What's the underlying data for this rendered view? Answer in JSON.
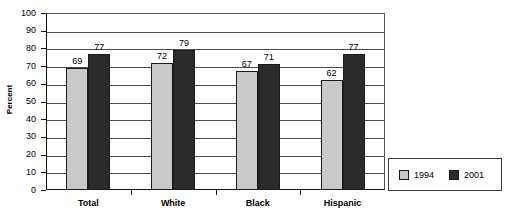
{
  "chart_data": {
    "type": "bar",
    "title": "",
    "subtitle": "",
    "xlabel": "",
    "ylabel": "Percent",
    "ylim": [
      0,
      100
    ],
    "ytick_step": 10,
    "yticks": [
      100,
      90,
      80,
      70,
      60,
      50,
      40,
      30,
      20,
      10,
      0
    ],
    "grid": true,
    "grid_axis": "y",
    "legend_position": "bottom-right",
    "categories": [
      "Total",
      "White",
      "Black",
      "Hispanic"
    ],
    "series": [
      {
        "name": "1994",
        "color": "#c9c9c9",
        "values": [
          69,
          72,
          67,
          62
        ]
      },
      {
        "name": "2001",
        "color": "#2b2b2b",
        "values": [
          77,
          79,
          71,
          77
        ]
      }
    ],
    "data_labels": [
      [
        "69",
        "72",
        "67",
        "62"
      ],
      [
        "77",
        "79",
        "71",
        "77"
      ]
    ]
  },
  "colors": {
    "series_1994": "#c9c9c9",
    "series_2001": "#2b2b2b",
    "axis": "#111111",
    "gridline": "#4a4a4a",
    "background": "#ffffff",
    "bar_border": "#1a1a1a"
  }
}
